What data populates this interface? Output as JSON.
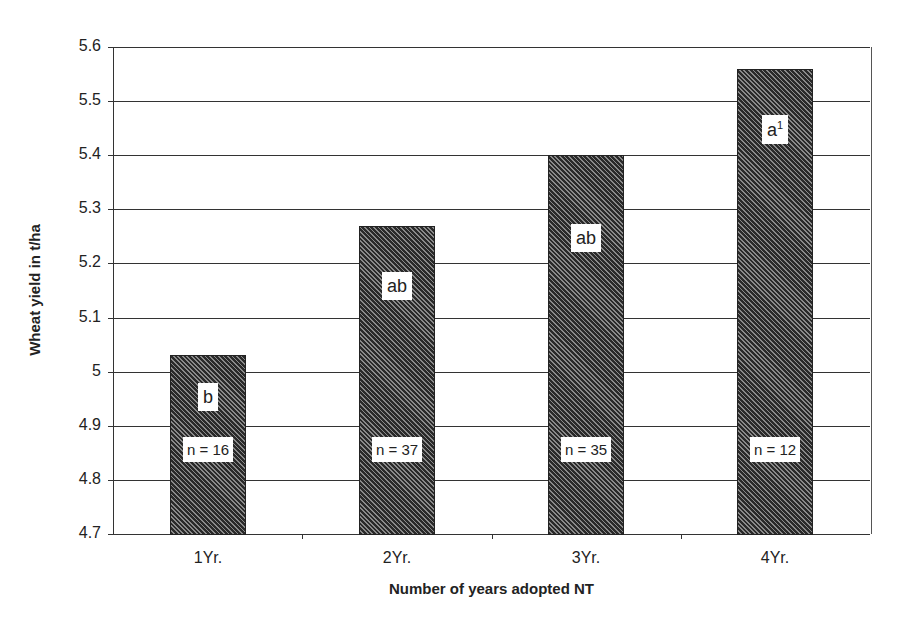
{
  "chart_data": {
    "type": "bar",
    "title": "",
    "xlabel": "Number of years adopted NT",
    "ylabel": "Wheat yield in t/ha",
    "categories": [
      "1Yr.",
      "2Yr.",
      "3Yr.",
      "4Yr."
    ],
    "values": [
      5.03,
      5.27,
      5.4,
      5.56
    ],
    "significance_letters": [
      "b",
      "ab",
      "ab",
      "a"
    ],
    "significance_superscripts": [
      "",
      "",
      "",
      "1"
    ],
    "sample_sizes": [
      "n = 16",
      "n = 37",
      "n = 35",
      "n = 12"
    ],
    "ylim": [
      4.7,
      5.6
    ],
    "yticks": [
      "5.6",
      "5.5",
      "5.4",
      "5.3",
      "5.2",
      "5.1",
      "5",
      "4.9",
      "4.8",
      "4.7"
    ],
    "grid": true,
    "legend": null,
    "bar_fill": "diagonal hatch (dark)",
    "colors": {
      "bar_dark": "#2a2a2a",
      "bar_light": "#8a8a8a",
      "grid": "#333333",
      "background": "#ffffff"
    }
  }
}
